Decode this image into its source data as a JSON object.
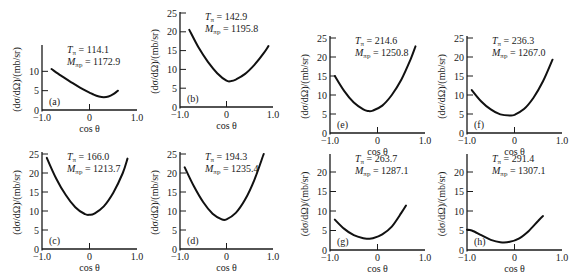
{
  "figure": {
    "ylabel": "(dσ/dΩ)/(mb/sr)",
    "xlabel": "cos θ",
    "xticks": [
      "−1.0",
      "0",
      "1.0"
    ]
  },
  "chart_data": [
    {
      "id": "a",
      "type": "line",
      "panel_label": "(a)",
      "T_pi": "114.1",
      "M_pi_p": "1172.9",
      "xlabel": "cos θ",
      "ylabel": "(dσ/dΩ)/(mb/sr)",
      "xlim": [
        -1,
        1
      ],
      "ylim": [
        0,
        15
      ],
      "yticks": [
        0,
        5,
        10
      ],
      "x": [
        -0.8,
        -0.6,
        -0.4,
        -0.2,
        0.0,
        0.1,
        0.2,
        0.3,
        0.4,
        0.5,
        0.6
      ],
      "y": [
        10.6,
        8.9,
        7.3,
        5.8,
        4.5,
        3.9,
        3.5,
        3.3,
        3.5,
        4.1,
        5.0
      ]
    },
    {
      "id": "b",
      "type": "line",
      "panel_label": "(b)",
      "T_pi": "142.9",
      "M_pi_p": "1195.8",
      "xlabel": "cos θ",
      "ylabel": "(dσ/dΩ)/(mb/sr)",
      "xlim": [
        -1,
        1
      ],
      "ylim": [
        0,
        25
      ],
      "yticks": [
        0,
        5,
        10,
        15,
        20,
        25
      ],
      "x": [
        -0.8,
        -0.6,
        -0.4,
        -0.2,
        0.0,
        0.1,
        0.2,
        0.4,
        0.6,
        0.8,
        0.9
      ],
      "y": [
        20.5,
        15.8,
        12.0,
        9.0,
        7.0,
        6.9,
        7.3,
        8.8,
        11.2,
        14.3,
        16.2
      ]
    },
    {
      "id": "c",
      "type": "line",
      "panel_label": "(c)",
      "T_pi": "166.0",
      "M_pi_p": "1213.7",
      "xlabel": "cos θ",
      "ylabel": "(dσ/dΩ)/(mb/sr)",
      "xlim": [
        -1,
        1
      ],
      "ylim": [
        0,
        25
      ],
      "yticks": [
        0,
        5,
        10,
        15,
        20,
        25
      ],
      "x": [
        -0.9,
        -0.7,
        -0.5,
        -0.3,
        -0.1,
        0.0,
        0.1,
        0.3,
        0.5,
        0.7,
        0.8
      ],
      "y": [
        24.0,
        18.5,
        14.2,
        11.0,
        9.2,
        9.0,
        9.3,
        11.2,
        14.8,
        20.0,
        23.8
      ]
    },
    {
      "id": "d",
      "type": "line",
      "panel_label": "(d)",
      "T_pi": "194.3",
      "M_pi_p": "1235.4",
      "xlabel": "cos θ",
      "ylabel": "(dσ/dΩ)/(mb/sr)",
      "xlim": [
        -1,
        1
      ],
      "ylim": [
        0,
        25
      ],
      "yticks": [
        0,
        5,
        10,
        15,
        20,
        25
      ],
      "x": [
        -0.9,
        -0.7,
        -0.5,
        -0.3,
        -0.1,
        0.0,
        0.2,
        0.4,
        0.6,
        0.8
      ],
      "y": [
        21.5,
        16.5,
        12.3,
        9.3,
        7.8,
        7.8,
        9.5,
        13.0,
        18.2,
        25.0
      ]
    },
    {
      "id": "e",
      "type": "line",
      "panel_label": "(e)",
      "T_pi": "214.6",
      "M_pi_p": "1250.8",
      "xlabel": "cos θ",
      "ylabel": "(dσ/dΩ)/(mb/sr)",
      "xlim": [
        -1,
        1
      ],
      "ylim": [
        0,
        25
      ],
      "yticks": [
        0,
        5,
        10,
        15,
        20,
        25
      ],
      "x": [
        -0.9,
        -0.7,
        -0.5,
        -0.3,
        -0.2,
        -0.1,
        0.1,
        0.3,
        0.5,
        0.7,
        0.8
      ],
      "y": [
        15.0,
        11.0,
        8.0,
        6.2,
        5.8,
        5.9,
        7.2,
        10.0,
        14.0,
        19.5,
        22.8
      ]
    },
    {
      "id": "f",
      "type": "line",
      "panel_label": "(f)",
      "T_pi": "236.3",
      "M_pi_p": "1267.0",
      "xlabel": "cos θ",
      "ylabel": "(dσ/dΩ)/(mb/sr)",
      "xlim": [
        -1,
        1
      ],
      "ylim": [
        0,
        25
      ],
      "yticks": [
        0,
        5,
        10,
        15,
        20,
        25
      ],
      "x": [
        -0.9,
        -0.7,
        -0.5,
        -0.3,
        -0.1,
        0.0,
        0.2,
        0.4,
        0.6,
        0.8
      ],
      "y": [
        11.3,
        8.3,
        6.2,
        4.9,
        4.6,
        4.8,
        6.3,
        9.3,
        13.6,
        19.3
      ]
    },
    {
      "id": "g",
      "type": "line",
      "panel_label": "(g)",
      "T_pi": "263.7",
      "M_pi_p": "1287.1",
      "xlabel": "cos θ",
      "ylabel": "(dσ/dΩ)/(mb/sr)",
      "xlim": [
        -1,
        1
      ],
      "ylim": [
        0,
        20
      ],
      "yticks": [
        0,
        5,
        10,
        15,
        20
      ],
      "x": [
        -0.9,
        -0.7,
        -0.5,
        -0.3,
        -0.2,
        -0.1,
        0.1,
        0.3,
        0.5,
        0.6
      ],
      "y": [
        7.8,
        5.4,
        3.8,
        3.0,
        2.9,
        3.0,
        4.0,
        6.0,
        9.5,
        11.4
      ]
    },
    {
      "id": "h",
      "type": "line",
      "panel_label": "(h)",
      "T_pi": "291.4",
      "M_pi_p": "1307.1",
      "xlabel": "cos θ",
      "ylabel": "(dσ/dΩ)/(mb/sr)",
      "xlim": [
        -1,
        1
      ],
      "ylim": [
        0,
        20
      ],
      "yticks": [
        0,
        5,
        10,
        15,
        20
      ],
      "x": [
        -1.0,
        -0.9,
        -0.7,
        -0.5,
        -0.3,
        -0.1,
        0.1,
        0.3,
        0.5,
        0.6
      ],
      "y": [
        5.2,
        5.0,
        3.8,
        2.6,
        2.0,
        2.1,
        3.0,
        4.9,
        7.5,
        8.7
      ]
    }
  ],
  "layout": {
    "panels": {
      "a": {
        "x0": 42,
        "y0": 110,
        "x1": 137,
        "ytop": 45,
        "ymaxpx": 52,
        "ymaxval": 15
      },
      "b": {
        "x0": 180,
        "y0": 107,
        "x1": 273,
        "ytop": 12,
        "ymaxpx": 13,
        "ymaxval": 25
      },
      "c": {
        "x0": 42,
        "y0": 249,
        "x1": 137,
        "ytop": 152,
        "ymaxpx": 154,
        "ymaxval": 25
      },
      "d": {
        "x0": 180,
        "y0": 249,
        "x1": 273,
        "ytop": 152,
        "ymaxpx": 154,
        "ymaxval": 25
      },
      "e": {
        "x0": 330,
        "y0": 133,
        "x1": 425,
        "ytop": 36,
        "ymaxpx": 38,
        "ymaxval": 25
      },
      "f": {
        "x0": 467,
        "y0": 133,
        "x1": 562,
        "ytop": 36,
        "ymaxpx": 38,
        "ymaxval": 25
      },
      "g": {
        "x0": 330,
        "y0": 250,
        "x1": 425,
        "ytop": 154,
        "ymaxpx": 172,
        "ymaxval": 20
      },
      "h": {
        "x0": 467,
        "y0": 250,
        "x1": 562,
        "ytop": 154,
        "ymaxpx": 172,
        "ymaxval": 20
      }
    }
  }
}
